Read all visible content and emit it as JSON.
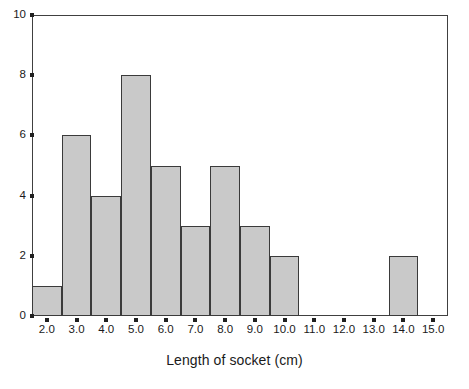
{
  "chart_data": {
    "type": "bar",
    "title": "",
    "subtitle": "",
    "xlabel": "Length of socket (cm)",
    "ylabel": "",
    "categories": [
      "2.0",
      "3.0",
      "4.0",
      "5.0",
      "6.0",
      "7.0",
      "8.0",
      "9.0",
      "10.0",
      "11.0",
      "12.0",
      "13.0",
      "14.0",
      "15.0"
    ],
    "values": [
      1,
      6,
      4,
      8,
      5,
      3,
      5,
      3,
      2,
      0,
      0,
      0,
      2,
      0
    ],
    "xlim": [
      1.5,
      15.5
    ],
    "ylim": [
      0,
      10
    ],
    "x_tick_labels": [
      "2.0",
      "3.0",
      "4.0",
      "5.0",
      "6.0",
      "7.0",
      "8.0",
      "9.0",
      "10.0",
      "11.0",
      "12.0",
      "13.0",
      "14.0",
      "15.0"
    ],
    "x_tick_values": [
      2,
      3,
      4,
      5,
      6,
      7,
      8,
      9,
      10,
      11,
      12,
      13,
      14,
      15
    ],
    "y_tick_labels": [
      "0",
      "2",
      "4",
      "6",
      "8",
      "10"
    ],
    "y_tick_values": [
      0,
      2,
      4,
      6,
      8,
      10
    ],
    "bin_width": 1,
    "grid": false,
    "legend": false,
    "legend_position": "none",
    "bar_fill_color": "#c9c9c9",
    "bar_border_color": "#3a3a3a",
    "axis_color": "#404040",
    "text_color": "#1a1a1a",
    "background_color": "#ffffff"
  }
}
